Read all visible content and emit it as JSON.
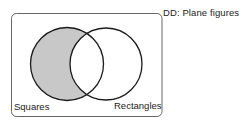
{
  "diagram": {
    "type": "venn",
    "title": "DD: Plane figures",
    "universe_label": "Plane figures",
    "sets": [
      {
        "name": "Squares",
        "label": "Squares",
        "shaded": true
      },
      {
        "name": "Rectangles",
        "label": "Rectangles",
        "shaded": false
      }
    ],
    "shaded_region": "Squares only (Squares minus Rectangles)",
    "colors": {
      "shade": "#c8c8c8",
      "stroke": "#1a1a1a",
      "frame": "#555555",
      "background": "#ffffff"
    }
  }
}
